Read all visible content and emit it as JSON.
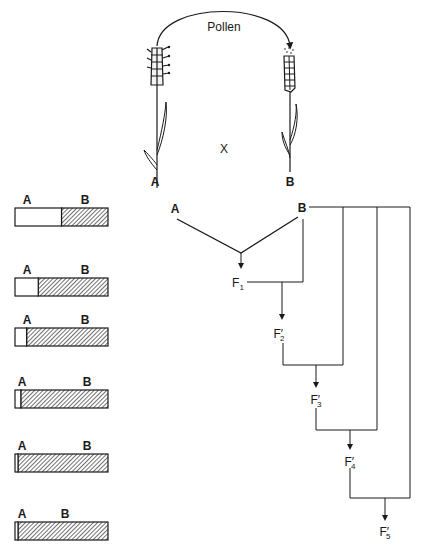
{
  "cross": {
    "pollen_label": "Pollen",
    "cross_symbol": "X",
    "parent_a_label": "A",
    "parent_b_label": "B"
  },
  "bars": [
    {
      "label_a": "A",
      "label_b": "B",
      "fraction_a": 0.5
    },
    {
      "label_a": "A",
      "label_b": "B",
      "fraction_a": 0.25
    },
    {
      "label_a": "A",
      "label_b": "B",
      "fraction_a": 0.125
    },
    {
      "label_a": "A",
      "label_b": "B",
      "fraction_a": 0.0625
    },
    {
      "label_a": "A",
      "label_b": "B",
      "fraction_a": 0.03125
    },
    {
      "label_a": "A",
      "label_b": "B",
      "fraction_a": 0.015625
    }
  ],
  "pedigree": {
    "parent_a": "A",
    "parent_b": "B",
    "generations": [
      {
        "base": "F",
        "sub": "1",
        "prime": ""
      },
      {
        "base": "F",
        "sub": "2",
        "prime": "′"
      },
      {
        "base": "F",
        "sub": "3",
        "prime": "′"
      },
      {
        "base": "F",
        "sub": "4",
        "prime": "′"
      },
      {
        "base": "F",
        "sub": "5",
        "prime": "′"
      }
    ]
  },
  "colors": {
    "ink": "#1a1a1a",
    "background": "#ffffff"
  }
}
